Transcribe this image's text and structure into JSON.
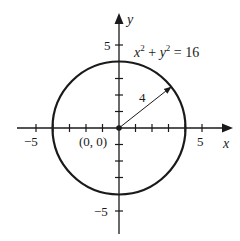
{
  "diagram": {
    "type": "circle-on-coordinate-plane",
    "equation": {
      "x_part": "x",
      "x_exp": "2",
      "plus": " + ",
      "y_part": "y",
      "y_exp": "2",
      "equals": " = 16"
    },
    "center_label": "(0, 0)",
    "radius_label": "4",
    "axes": {
      "x_label": "x",
      "y_label": "y",
      "x_ticks": [
        "−5",
        "5"
      ],
      "y_ticks": [
        "5",
        "−5"
      ],
      "range": [
        -5,
        5
      ]
    },
    "colors": {
      "stroke": "#1a1a1a",
      "background": "#ffffff"
    }
  }
}
